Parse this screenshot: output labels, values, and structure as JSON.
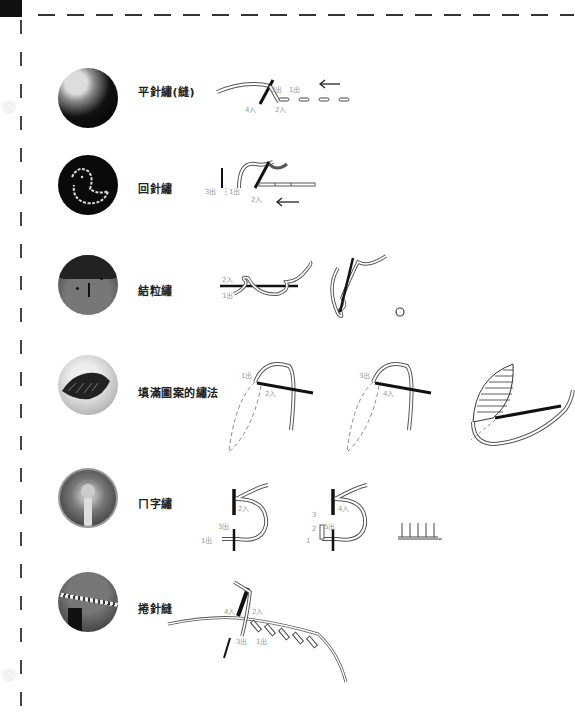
{
  "page": {
    "type": "embroidery stitch reference page",
    "border": "dashed cut line top and left"
  },
  "stitches": [
    {
      "name": "平針繡(縫)",
      "photo": "round felt badge with running stitch border",
      "diagram_labels": [
        "3出",
        "1出",
        "4入",
        "2入"
      ],
      "direction_arrow": "left"
    },
    {
      "name": "回針繡",
      "photo": "black felt with white bird outline in back stitch",
      "diagram_labels": [
        "3出",
        "1出",
        "2入"
      ],
      "direction_arrow": "left"
    },
    {
      "name": "結粒繡",
      "photo": "felt face with french knot hair",
      "diagram_labels": [
        "2入",
        "1出"
      ]
    },
    {
      "name": "填滿圖案的繡法",
      "photo": "felt hedgehog with satin stitch fill",
      "diagram_labels": [
        "1出",
        "2入",
        "3出",
        "4入"
      ]
    },
    {
      "name": "ㄇ字繡",
      "photo": "round felt ornament with blanket stitch edge",
      "diagram_labels": [
        "2入",
        "3出",
        "1出",
        "3",
        "4入",
        "2",
        "5出",
        "1"
      ]
    },
    {
      "name": "捲針縫",
      "photo": "felt piece with whip stitch edge",
      "diagram_labels": [
        "4入",
        "2入",
        "3出",
        "1出"
      ]
    }
  ]
}
